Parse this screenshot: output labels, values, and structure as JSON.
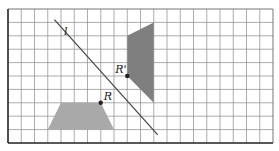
{
  "diagram": {
    "grid": {
      "columns": 20,
      "rows": 10
    },
    "colors": {
      "original_shape": "#a9a9a9",
      "image_shape": "#7f7f7f",
      "line": "#444444",
      "point": "#222222"
    },
    "line": {
      "label": "l",
      "from": [
        3.5,
        0.8
      ],
      "to": [
        11.3,
        9.4
      ]
    },
    "original_shape": {
      "name": "trapezoid",
      "vertices": [
        [
          4,
          7
        ],
        [
          7,
          7
        ],
        [
          8,
          9
        ],
        [
          3,
          9
        ]
      ]
    },
    "image_shape": {
      "name": "reflected-quadrilateral",
      "vertices": [
        [
          11,
          1
        ],
        [
          9,
          2
        ],
        [
          9,
          5
        ],
        [
          11,
          7
        ]
      ]
    },
    "point_R": {
      "label": "R",
      "at": [
        7,
        7
      ]
    },
    "point_R_prime": {
      "label": "R'",
      "at": [
        9,
        5
      ]
    }
  }
}
